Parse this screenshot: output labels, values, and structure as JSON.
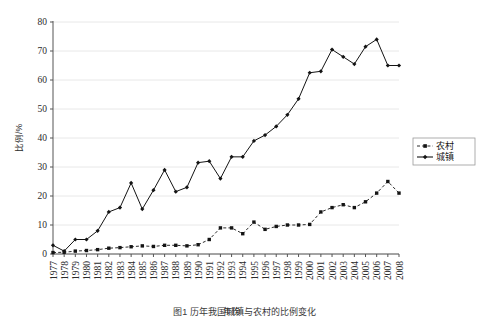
{
  "chart_data": {
    "type": "line",
    "title": "",
    "xlabel": "年份",
    "ylabel": "比例/%",
    "xlim": [
      1976.4,
      2008.8
    ],
    "ylim": [
      0,
      80
    ],
    "yticks": [
      0,
      10,
      20,
      30,
      40,
      50,
      60,
      70,
      80
    ],
    "grid": true,
    "legend_position": "right",
    "categories": [
      "1977",
      "1978",
      "1979",
      "1980",
      "1981",
      "1982",
      "1983",
      "1984",
      "1985",
      "1986",
      "1987",
      "1988",
      "1989",
      "1990",
      "1991",
      "1992",
      "1993",
      "1994",
      "1995",
      "1996",
      "1997",
      "1998",
      "1999",
      "2000",
      "2001",
      "2002",
      "2003",
      "2004",
      "2005",
      "2006",
      "2007",
      "2008"
    ],
    "series": [
      {
        "name": "农村",
        "style": "dashed",
        "marker": "square",
        "values": [
          0.5,
          0.6,
          1.0,
          1.2,
          1.5,
          2.0,
          2.2,
          2.5,
          2.8,
          2.6,
          3.0,
          3.0,
          2.8,
          3.2,
          5.0,
          9.0,
          9.0,
          7.0,
          11.0,
          8.5,
          9.5,
          10.0,
          10.0,
          10.2,
          14.5,
          16.0,
          17.0,
          16.0,
          18.0,
          21.0,
          25.0,
          21.0
        ]
      },
      {
        "name": "城镇",
        "style": "solid",
        "marker": "diamond",
        "values": [
          3.0,
          1.0,
          5.0,
          5.0,
          8.0,
          14.5,
          16.0,
          24.5,
          15.5,
          22.0,
          29.0,
          21.5,
          23.0,
          31.5,
          32.0,
          26.0,
          33.5,
          33.5,
          39.0,
          41.0,
          44.0,
          48.0,
          53.5,
          62.5,
          63.0,
          70.5,
          68.0,
          65.5,
          71.5,
          74.0,
          65.0,
          65.0
        ]
      }
    ]
  },
  "legend": {
    "items": [
      {
        "label": "农村"
      },
      {
        "label": "城镇"
      }
    ]
  },
  "axes": {
    "y_label": "比例/%",
    "x_label": "年份",
    "y_ticks": [
      "0",
      "10",
      "20",
      "30",
      "40",
      "50",
      "60",
      "70",
      "80"
    ]
  },
  "caption": {
    "text": "图1  历年我国城镇与农村的比例变化"
  },
  "colors": {
    "line": "#141414",
    "grid": "#e2e2e2",
    "axis": "#555555",
    "legend_border": "#9a9a9a",
    "background": "#ffffff"
  }
}
